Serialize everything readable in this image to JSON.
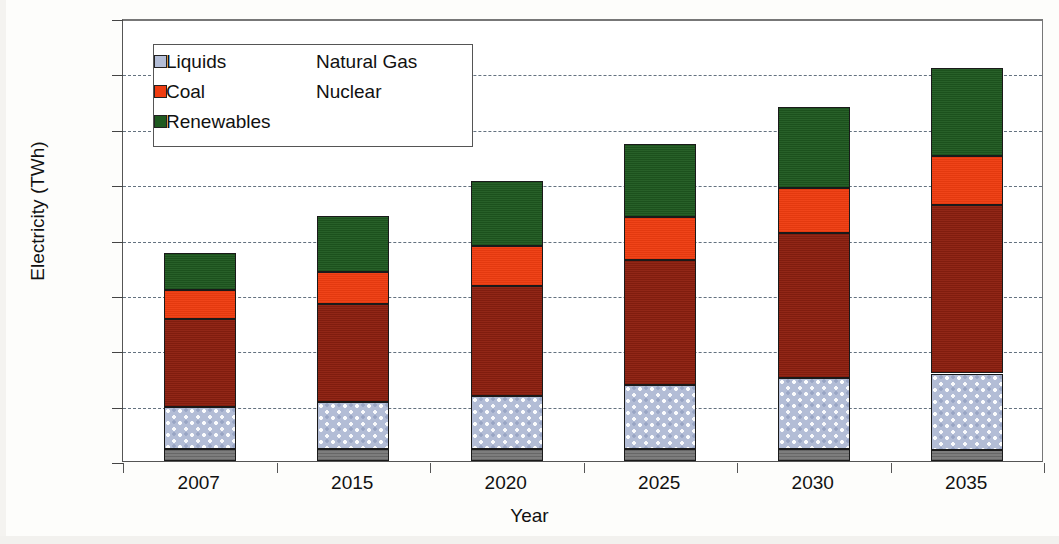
{
  "chart_data": {
    "type": "bar",
    "stacked": true,
    "title": "",
    "xlabel": "Year",
    "ylabel": "Electricity (TWh)",
    "categories": [
      "2007",
      "2015",
      "2020",
      "2025",
      "2030",
      "2035"
    ],
    "ylim": [
      0,
      40000
    ],
    "ytick_labels": [
      "0",
      "5000",
      "10000",
      "15000",
      "20000",
      "25000",
      "30000",
      "35000",
      "40000"
    ],
    "ytick_values": [
      0,
      5000,
      10000,
      15000,
      20000,
      25000,
      30000,
      35000,
      40000
    ],
    "grid": "horizontal-dashed",
    "legend_position": "upper-left-inside",
    "series": [
      {
        "name": "Liquids",
        "color": "#7d7d7d",
        "values": [
          1100,
          1100,
          1100,
          1050,
          1050,
          1000
        ]
      },
      {
        "name": "Natural Gas",
        "color": "#b3bdd6",
        "values": [
          3800,
          4200,
          4800,
          5800,
          6400,
          6900
        ]
      },
      {
        "name": "Coal",
        "color": "#8e2010",
        "values": [
          7900,
          8900,
          9900,
          11300,
          13100,
          15200
        ]
      },
      {
        "name": "Nuclear",
        "color": "#ef3c10",
        "values": [
          2600,
          2900,
          3600,
          3900,
          4100,
          4400
        ]
      },
      {
        "name": "Renewables",
        "color": "#1f5a20",
        "values": [
          3400,
          5000,
          5900,
          6600,
          7300,
          8000
        ]
      }
    ],
    "totals": [
      18800,
      22100,
      25300,
      28650,
      31950,
      35500
    ],
    "cumulative_tops": {
      "2007": {
        "liquids": 1100,
        "natural_gas": 4900,
        "coal": 12800,
        "nuclear": 15400,
        "renewables": 18800
      },
      "2015": {
        "liquids": 1100,
        "natural_gas": 5300,
        "coal": 14200,
        "nuclear": 17100,
        "renewables": 22100
      },
      "2020": {
        "liquids": 1100,
        "natural_gas": 5900,
        "coal": 15800,
        "nuclear": 19400,
        "renewables": 25300
      },
      "2025": {
        "liquids": 1050,
        "natural_gas": 6850,
        "coal": 18150,
        "nuclear": 22050,
        "renewables": 28650
      },
      "2030": {
        "liquids": 1050,
        "natural_gas": 7450,
        "coal": 20550,
        "nuclear": 24650,
        "renewables": 31950
      },
      "2035": {
        "liquids": 1000,
        "natural_gas": 7900,
        "coal": 23100,
        "nuclear": 27500,
        "renewables": 35500
      }
    }
  },
  "legend": {
    "items": [
      {
        "label": "Liquids",
        "color": "#7d7d7d"
      },
      {
        "label": "Natural Gas",
        "color": "#b3bdd6"
      },
      {
        "label": "Coal",
        "color": "#8e2010"
      },
      {
        "label": "Nuclear",
        "color": "#ef3c10"
      },
      {
        "label": "Renewables",
        "color": "#1f5a20"
      }
    ]
  },
  "axes": {
    "y_title": "Electricity (TWh)",
    "x_title": "Year"
  }
}
